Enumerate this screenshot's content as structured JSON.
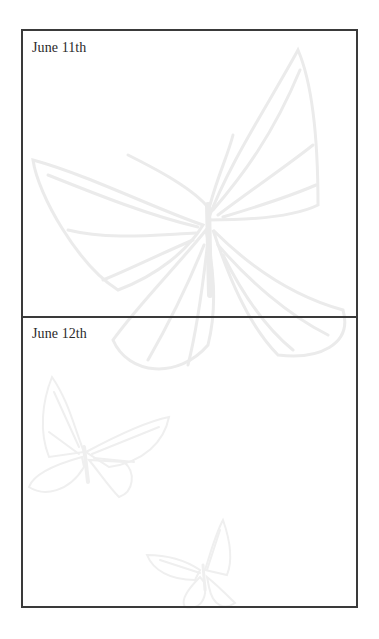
{
  "journal": {
    "entries": [
      {
        "date": "June 11th",
        "content": ""
      },
      {
        "date": "June 12th",
        "content": ""
      }
    ]
  },
  "decoration": {
    "watermark": "butterfly-illustration",
    "watermark_color": "#ececec",
    "border_color": "#3a3a3a",
    "text_color": "#2a2a2a"
  }
}
